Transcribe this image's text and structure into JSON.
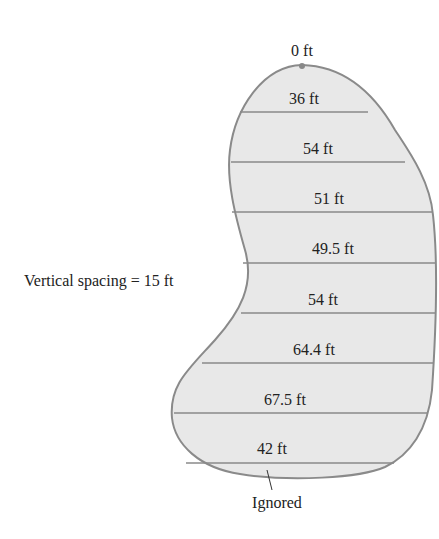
{
  "diagram": {
    "top_label": "0 ft",
    "spacing_label": "Vertical spacing = 15 ft",
    "ignored_label": "Ignored",
    "vertical_spacing_ft": 15,
    "widths": [
      {
        "label": "36 ft",
        "value": 36
      },
      {
        "label": "54 ft",
        "value": 54
      },
      {
        "label": "51 ft",
        "value": 51
      },
      {
        "label": "49.5 ft",
        "value": 49.5
      },
      {
        "label": "54 ft",
        "value": 54
      },
      {
        "label": "64.4 ft",
        "value": 64.4
      },
      {
        "label": "67.5 ft",
        "value": 67.5
      },
      {
        "label": "42 ft",
        "value": 42
      }
    ],
    "colors": {
      "fill": "#e8e8e8",
      "stroke": "#8a8a8a",
      "text": "#222222"
    }
  }
}
